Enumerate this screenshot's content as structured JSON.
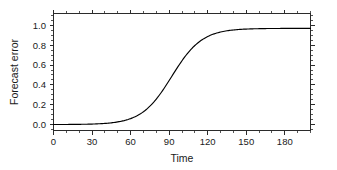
{
  "figure": {
    "background_color": "#ffffff",
    "axis_color": "#2b2b2b",
    "curve_color": "#000000"
  },
  "labels": {
    "xlabel": "Time",
    "ylabel": "Forecast error"
  },
  "chart_data": {
    "type": "line",
    "title": "",
    "subtitle": "",
    "xlabel": "Time",
    "ylabel": "Forecast error",
    "xlim": [
      0,
      200
    ],
    "ylim": [
      -0.06,
      1.12
    ],
    "grid": false,
    "legend": false,
    "legend_position": "none",
    "xticks": [
      0,
      30,
      60,
      90,
      120,
      150,
      180
    ],
    "xticklabels": [
      "0",
      "30",
      "60",
      "90",
      "120",
      "150",
      "180"
    ],
    "x_minor_tick_interval": 10,
    "yticks": [
      0.0,
      0.2,
      0.4,
      0.6,
      0.8,
      1.0
    ],
    "yticklabels": [
      "0.0",
      "0.2",
      "0.4",
      "0.6",
      "0.8",
      "1.0"
    ],
    "y_minor_tick_interval": 0.05,
    "tick_direction": "out",
    "frame": "box",
    "annotations": [],
    "series": [
      {
        "name": "forecast error",
        "shape": "sigmoid",
        "asymptote": 0.97,
        "midpoint": 92,
        "steepness": 0.085,
        "x": [
          0,
          5,
          10,
          15,
          20,
          25,
          30,
          35,
          40,
          45,
          50,
          55,
          60,
          65,
          70,
          75,
          80,
          85,
          90,
          95,
          100,
          105,
          110,
          115,
          120,
          125,
          130,
          135,
          140,
          145,
          150,
          155,
          160,
          165,
          170,
          175,
          180,
          185,
          190,
          195,
          200
        ],
        "y": [
          0.004,
          0.005,
          0.008,
          0.012,
          0.018,
          0.026,
          0.038,
          0.055,
          0.078,
          0.109,
          0.15,
          0.2,
          0.26,
          0.33,
          0.405,
          0.485,
          0.565,
          0.64,
          0.71,
          0.775,
          0.825,
          0.865,
          0.895,
          0.918,
          0.934,
          0.946,
          0.954,
          0.96,
          0.964,
          0.966,
          0.968,
          0.969,
          0.97,
          0.97,
          0.97,
          0.97,
          0.97,
          0.97,
          0.97,
          0.97,
          0.97
        ]
      }
    ]
  }
}
